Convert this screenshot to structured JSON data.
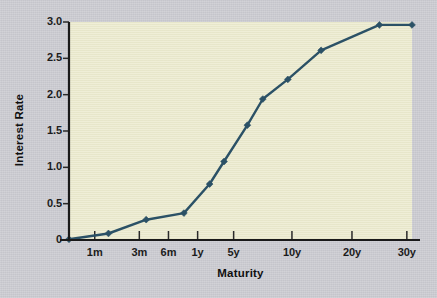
{
  "chart_data": {
    "type": "line",
    "title": "",
    "xlabel": "Maturity",
    "ylabel": "Interest Rate",
    "categories": [
      "1m",
      "3m",
      "6m",
      "1y",
      "2y",
      "3y",
      "4y",
      "5y",
      "7y",
      "10y",
      "20y",
      "30y"
    ],
    "values": [
      0.01,
      0.09,
      0.28,
      0.37,
      0.77,
      1.08,
      1.58,
      1.94,
      2.21,
      2.61,
      2.96,
      2.96
    ],
    "series": [
      {
        "name": "Yield curve",
        "color": "#2b5166",
        "points": [
          {
            "x": "1m",
            "x_pos": 0.0,
            "y": 0.01
          },
          {
            "x": "3m",
            "x_pos": 0.115,
            "y": 0.09
          },
          {
            "x": "6m",
            "x_pos": 0.225,
            "y": 0.28
          },
          {
            "x": "1y",
            "x_pos": 0.335,
            "y": 0.37
          },
          {
            "x": "2y",
            "x_pos": 0.41,
            "y": 0.77
          },
          {
            "x": "3y",
            "x_pos": 0.452,
            "y": 1.08
          },
          {
            "x": "4y",
            "x_pos": 0.52,
            "y": 1.58
          },
          {
            "x": "5y",
            "x_pos": 0.565,
            "y": 1.94
          },
          {
            "x": "7y",
            "x_pos": 0.638,
            "y": 2.21
          },
          {
            "x": "10y",
            "x_pos": 0.735,
            "y": 2.61
          },
          {
            "x": "20y",
            "x_pos": 0.905,
            "y": 2.96
          },
          {
            "x": "30y",
            "x_pos": 1.0,
            "y": 2.96
          }
        ]
      }
    ],
    "x_ticks": [
      {
        "label": "1m",
        "pos": 0.075
      },
      {
        "label": "3m",
        "pos": 0.205
      },
      {
        "label": "6m",
        "pos": 0.29
      },
      {
        "label": "1y",
        "pos": 0.375
      },
      {
        "label": "5y",
        "pos": 0.48
      },
      {
        "label": "10y",
        "pos": 0.65
      },
      {
        "label": "20y",
        "pos": 0.825
      },
      {
        "label": "30y",
        "pos": 0.985
      }
    ],
    "y_ticks": [
      "0",
      "0.5",
      "1.0",
      "1.5",
      "2.0",
      "2.5",
      "3.0"
    ],
    "ylim": [
      0,
      3.0
    ],
    "grid": false,
    "legend": "none",
    "plot_background": "#ecebcf",
    "page_background": "#c9c9cf",
    "axis_color": "#1a1a1a"
  }
}
